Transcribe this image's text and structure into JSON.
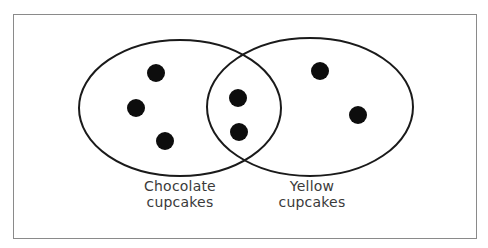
{
  "diagram": {
    "type": "venn",
    "sets": [
      {
        "id": "chocolate",
        "label_line1": "Chocolate",
        "label_line2": "cupcakes",
        "ellipse": {
          "cx": 180,
          "cy": 108,
          "rx": 101,
          "ry": 68
        },
        "only_count": 3
      },
      {
        "id": "yellow",
        "label_line1": "Yellow",
        "label_line2": "cupcakes",
        "ellipse": {
          "cx": 310,
          "cy": 107,
          "rx": 103,
          "ry": 69
        },
        "only_count": 2
      }
    ],
    "intersection_count": 2,
    "dots": [
      {
        "region": "chocolate-only",
        "x": 156,
        "y": 73
      },
      {
        "region": "chocolate-only",
        "x": 136,
        "y": 108
      },
      {
        "region": "chocolate-only",
        "x": 165,
        "y": 141
      },
      {
        "region": "both",
        "x": 238,
        "y": 98
      },
      {
        "region": "both",
        "x": 239,
        "y": 132
      },
      {
        "region": "yellow-only",
        "x": 320,
        "y": 71
      },
      {
        "region": "yellow-only",
        "x": 358,
        "y": 115
      }
    ],
    "colors": {
      "outline": "#1a1a1a",
      "dot": "#0d0d0d",
      "frame": "#8a8a8a",
      "label": "#3a3a3a"
    }
  }
}
